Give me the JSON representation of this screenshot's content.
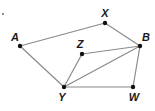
{
  "diagram": {
    "type": "graph",
    "colors": {
      "edge": "#8a8a8a",
      "point": "#111111",
      "label": "#1a1a1a"
    },
    "points": [
      {
        "id": "A",
        "label": "A",
        "x": 20,
        "y": 46,
        "lx": 15,
        "ly": 41
      },
      {
        "id": "X",
        "label": "X",
        "x": 105,
        "y": 23,
        "lx": 105,
        "ly": 17
      },
      {
        "id": "B",
        "label": "B",
        "x": 140,
        "y": 46,
        "lx": 146,
        "ly": 41
      },
      {
        "id": "Z",
        "label": "Z",
        "x": 82,
        "y": 54,
        "lx": 80,
        "ly": 48
      },
      {
        "id": "Y",
        "label": "Y",
        "x": 64,
        "y": 87,
        "lx": 62,
        "ly": 101
      },
      {
        "id": "W",
        "label": "W",
        "x": 133,
        "y": 87,
        "lx": 134,
        "ly": 101
      }
    ],
    "edges": [
      [
        "A",
        "X"
      ],
      [
        "X",
        "B"
      ],
      [
        "A",
        "Y"
      ],
      [
        "Y",
        "Z"
      ],
      [
        "Z",
        "B"
      ],
      [
        "Y",
        "B"
      ],
      [
        "Y",
        "W"
      ],
      [
        "W",
        "B"
      ]
    ],
    "stray_mark": {
      "x": 3,
      "y": 14
    }
  }
}
